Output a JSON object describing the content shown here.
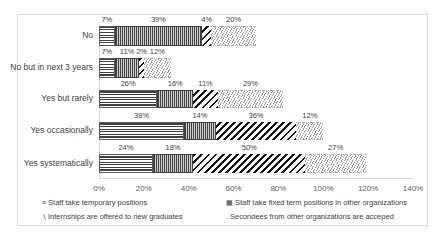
{
  "chart_data": {
    "type": "bar",
    "orientation": "horizontal",
    "stacked": true,
    "title": "",
    "xlabel": "",
    "ylabel": "",
    "categories": [
      "No",
      "No but in next 3 years",
      "Yes but rarely",
      "Yes occasionally",
      "Yes systematically"
    ],
    "series": [
      {
        "name": "Staff take temporary positions",
        "pattern": "horizontal-lines",
        "values": [
          7,
          11,
          26,
          38,
          24
        ]
      },
      {
        "name": "Staff take  fixed term positions in other organizations",
        "pattern": "vertical-lines",
        "values": [
          39,
          11,
          16,
          14,
          18
        ]
      },
      {
        "name": "Internships are offered to new graduates",
        "pattern": "wide-diagonal",
        "values": [
          4,
          2,
          11,
          36,
          50
        ]
      },
      {
        "name": "Secondees from other organizations are acceped",
        "pattern": "light-diagonal",
        "values": [
          20,
          12,
          29,
          12,
          27
        ]
      }
    ],
    "xlim": [
      0,
      140
    ],
    "xticks": [
      "0%",
      "20%",
      "40%",
      "60%",
      "80%",
      "100%",
      "120%",
      "140%"
    ],
    "grid": false,
    "legend_position": "bottom"
  },
  "rows": [
    {
      "label": "No",
      "labels": [
        "7%",
        "39%",
        "4%",
        "20%"
      ],
      "values": [
        7,
        39,
        4,
        20
      ]
    },
    {
      "label": "No but in next 3 years",
      "labels": [
        "7%",
        "11%",
        "2%",
        "12%"
      ],
      "values": [
        7,
        11,
        2,
        12
      ]
    },
    {
      "label": "Yes but rarely",
      "labels": [
        "26%",
        "16%",
        "11%",
        "29%"
      ],
      "values": [
        26,
        16,
        11,
        29
      ]
    },
    {
      "label": "Yes occasionally",
      "labels": [
        "38%",
        "14%",
        "36%",
        "12%"
      ],
      "values": [
        38,
        14,
        36,
        12
      ]
    },
    {
      "label": "Yes systematically",
      "labels": [
        "24%",
        "18%",
        "50%",
        "27%"
      ],
      "values": [
        24,
        18,
        50,
        27
      ]
    }
  ],
  "axis": {
    "ticks": [
      "0%",
      "20%",
      "40%",
      "60%",
      "80%",
      "100%",
      "120%",
      "140%"
    ]
  },
  "legend": [
    {
      "marker": "≡",
      "label": "Staff take temporary positions"
    },
    {
      "marker": "▦",
      "label": "Staff take  fixed term positions in other organizations"
    },
    {
      "marker": "∖",
      "label": "Internships are offered to new graduates"
    },
    {
      "marker": ".",
      "label": "Secondees from other organizations are acceped"
    }
  ]
}
